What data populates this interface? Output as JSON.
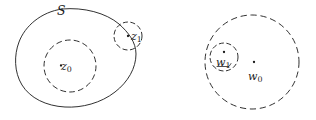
{
  "figure": {
    "background_color": "#ffffff",
    "stroke_color": "#1a1a1a",
    "width": 316,
    "height": 120,
    "panels": [
      {
        "id": "left-panel",
        "name": "domain-S-with-disks",
        "region_label": {
          "text": "S",
          "x": 62,
          "y": 12,
          "style": "italic"
        },
        "boundary": {
          "name": "region-S-outline",
          "style": "solid",
          "shape": "bean"
        },
        "disks": [
          {
            "name": "disk-z0",
            "label": "z",
            "subscript": "0",
            "center_x": 70,
            "center_y": 66,
            "radius": 26,
            "style": "dashed",
            "has_center_dot": true
          },
          {
            "name": "disk-z1",
            "label": "z",
            "subscript": "1",
            "center_x": 128,
            "center_y": 36,
            "radius": 14,
            "style": "dashed",
            "has_center_dot": true
          }
        ]
      },
      {
        "id": "right-panel",
        "name": "image-disks",
        "region_label": null,
        "disks": [
          {
            "name": "disk-w0",
            "label": "w",
            "subscript": "0",
            "center_x": 252,
            "center_y": 62,
            "radius": 47,
            "style": "dashed",
            "has_center_dot": true
          },
          {
            "name": "disk-w1",
            "label": "w",
            "subscript": "1",
            "center_x": 224,
            "center_y": 57,
            "radius": 14,
            "style": "dashed",
            "has_center_dot": true
          }
        ]
      }
    ]
  },
  "labels": {
    "S": "S",
    "z0_var": "z",
    "z0_sub": "0",
    "z1_var": "z",
    "z1_sub": "1",
    "w0_var": "w",
    "w0_sub": "0",
    "w1_var": "w",
    "w1_sub": "1"
  }
}
